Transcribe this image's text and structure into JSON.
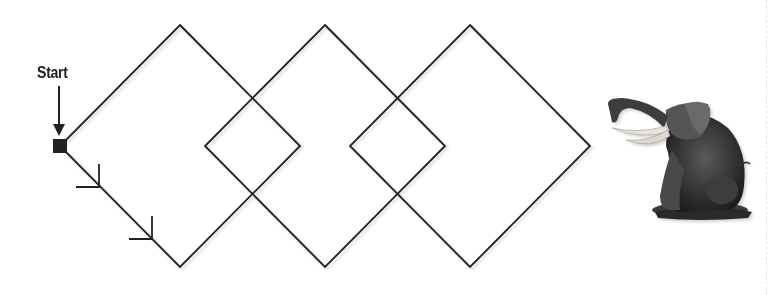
{
  "diagram": {
    "start_label": "Start",
    "stroke_color": "#222222",
    "start_marker": {
      "x": 60,
      "y": 146,
      "size": 12
    },
    "diamonds": [
      {
        "cx": 180,
        "cy": 146,
        "half_width": 120,
        "half_height": 121
      },
      {
        "cx": 325,
        "cy": 146,
        "half_width": 120,
        "half_height": 121
      },
      {
        "cx": 470,
        "cy": 146,
        "half_width": 120,
        "half_height": 121
      }
    ],
    "direction_arrows": 2,
    "image": {
      "subject": "elephant sculpture",
      "description": "Sitting elephant with raised trunk and tusks"
    }
  }
}
